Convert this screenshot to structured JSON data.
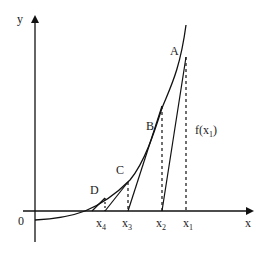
{
  "diagram": {
    "axes": {
      "x_label": "x",
      "y_label": "y",
      "origin_label": "0"
    },
    "points": [
      {
        "label": "A"
      },
      {
        "label": "B"
      },
      {
        "label": "C"
      },
      {
        "label": "D"
      }
    ],
    "x_ticks": [
      {
        "base": "x",
        "sub": "1"
      },
      {
        "base": "x",
        "sub": "2"
      },
      {
        "base": "x",
        "sub": "3"
      },
      {
        "base": "x",
        "sub": "4"
      }
    ],
    "fx_label": {
      "prefix": "f(x",
      "sub": "1",
      "suffix": ")"
    },
    "colors": {
      "line": "#111111",
      "text": "#222222",
      "background": "#ffffff"
    }
  }
}
